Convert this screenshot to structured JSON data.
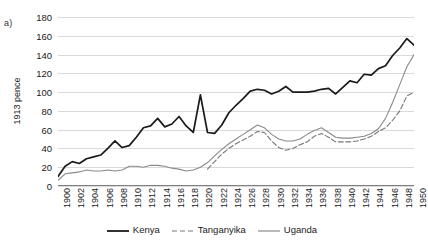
{
  "panel": {
    "label": "a)"
  },
  "chart_data": {
    "type": "line",
    "title": "",
    "xlabel": "",
    "ylabel": "1913 pence",
    "xlim": [
      1900,
      1950
    ],
    "ylim": [
      0,
      180
    ],
    "ytick_step": 20,
    "xtick_step": 2,
    "grid": true,
    "legend_position": "bottom",
    "yticks": [
      0,
      20,
      40,
      60,
      80,
      100,
      120,
      140,
      160,
      180
    ],
    "xticks": [
      1900,
      1902,
      1904,
      1906,
      1908,
      1910,
      1912,
      1914,
      1916,
      1918,
      1920,
      1922,
      1924,
      1926,
      1928,
      1930,
      1932,
      1934,
      1936,
      1938,
      1940,
      1942,
      1944,
      1946,
      1948,
      1950
    ],
    "colors": {
      "kenya": "#1a1a1a",
      "tanganyika": "#777777",
      "uganda": "#8a8a8a",
      "gridline": "#d9d9d9",
      "axis": "#808080"
    },
    "series": [
      {
        "name": "Kenya",
        "style": "solid",
        "color": "#1a1a1a",
        "x": [
          1900,
          1901,
          1902,
          1903,
          1904,
          1905,
          1906,
          1907,
          1908,
          1909,
          1910,
          1911,
          1912,
          1913,
          1914,
          1915,
          1916,
          1917,
          1918,
          1919,
          1920,
          1921,
          1922,
          1923,
          1924,
          1925,
          1926,
          1927,
          1928,
          1929,
          1930,
          1931,
          1932,
          1933,
          1934,
          1935,
          1936,
          1937,
          1938,
          1939,
          1940,
          1941,
          1942,
          1943,
          1944,
          1945,
          1946,
          1947,
          1948,
          1949,
          1950
        ],
        "y": [
          10,
          21,
          26,
          24,
          29,
          31,
          33,
          40,
          48,
          41,
          43,
          52,
          62,
          64,
          72,
          63,
          66,
          74,
          64,
          57,
          97,
          57,
          56,
          65,
          78,
          86,
          93,
          101,
          103,
          102,
          98,
          101,
          106,
          100,
          100,
          100,
          101,
          103,
          104,
          98,
          105,
          112,
          110,
          119,
          118,
          125,
          128,
          139,
          147,
          157,
          150
        ]
      },
      {
        "name": "Tanganyika",
        "style": "dashed",
        "color": "#777777",
        "x": [
          1921,
          1922,
          1923,
          1924,
          1925,
          1926,
          1927,
          1928,
          1929,
          1930,
          1931,
          1932,
          1933,
          1934,
          1935,
          1936,
          1937,
          1938,
          1939,
          1940,
          1941,
          1942,
          1943,
          1944,
          1945,
          1946,
          1947,
          1948,
          1949,
          1950
        ],
        "y": [
          18,
          26,
          34,
          40,
          45,
          49,
          53,
          58,
          57,
          48,
          41,
          38,
          40,
          44,
          47,
          53,
          56,
          52,
          47,
          47,
          47,
          48,
          50,
          53,
          58,
          62,
          70,
          80,
          96,
          100
        ]
      },
      {
        "name": "Uganda",
        "style": "solid",
        "color": "#8a8a8a",
        "x": [
          1900,
          1901,
          1902,
          1903,
          1904,
          1905,
          1906,
          1907,
          1908,
          1909,
          1910,
          1911,
          1912,
          1913,
          1914,
          1915,
          1916,
          1917,
          1918,
          1919,
          1920,
          1921,
          1922,
          1923,
          1924,
          1925,
          1926,
          1927,
          1928,
          1929,
          1930,
          1931,
          1932,
          1933,
          1934,
          1935,
          1936,
          1937,
          1938,
          1939,
          1940,
          1941,
          1942,
          1943,
          1944,
          1945,
          1946,
          1947,
          1948,
          1949,
          1950
        ],
        "y": [
          6,
          13,
          14,
          15,
          17,
          16,
          16,
          17,
          16,
          17,
          21,
          21,
          20,
          22,
          22,
          21,
          19,
          18,
          16,
          17,
          20,
          25,
          32,
          39,
          45,
          50,
          55,
          60,
          65,
          62,
          55,
          50,
          48,
          48,
          50,
          55,
          59,
          62,
          57,
          52,
          51,
          51,
          52,
          53,
          56,
          61,
          72,
          89,
          108,
          127,
          140
        ]
      }
    ]
  },
  "legend": {
    "items": [
      {
        "label": "Kenya",
        "style": "solid",
        "color": "#1a1a1a"
      },
      {
        "label": "Tanganyika",
        "style": "dashed",
        "color": "#777777"
      },
      {
        "label": "Uganda",
        "style": "solid",
        "color": "#8a8a8a"
      }
    ]
  }
}
